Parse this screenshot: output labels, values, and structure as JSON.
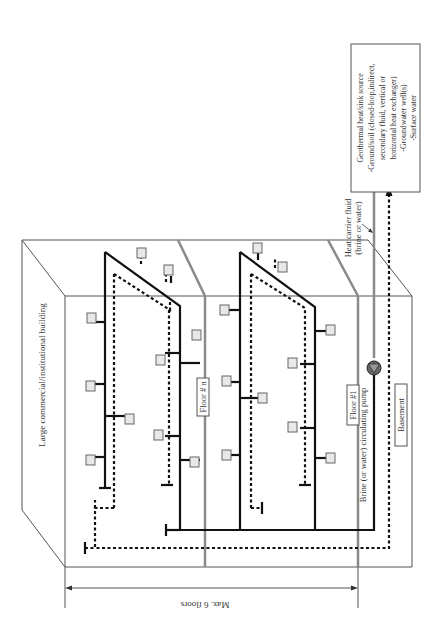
{
  "diagram": {
    "building_label": "Large commercial/institutional building",
    "floor_n_label": "Floor # n",
    "floor_1_label": "Floor #1",
    "basement_label": "Basement",
    "pump_label": "Brine (or water) circulating pump",
    "heat_carrier_label_line1": "Heat carrier fluid",
    "heat_carrier_label_line2": "(brine or water)",
    "dimension_label": "Max. 6 floors",
    "source_box": {
      "line1": "Geothermal heat/sink source",
      "line2": "-Ground/soil (closed-loop,indirect,",
      "line3": "secondary fluid, vertical or",
      "line4": "horizontal heat exchanger)",
      "line5": "-Groundwater well(s)",
      "line6": "-Surface water"
    },
    "legend_styles": {
      "supply_line": "solid",
      "return_line": "dashed"
    },
    "colors": {
      "pipe": "#111111",
      "outline": "#555555",
      "heat_carrier_pipe": "#8a8a8a",
      "unit_fill": "#e8e8e8"
    }
  }
}
